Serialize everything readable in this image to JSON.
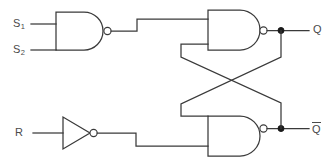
{
  "diagram": {
    "type": "logic-circuit-schematic",
    "background_color": "#ffffff",
    "line_color": "#3a3a3a",
    "label_color": "#4a4a4a",
    "width": 334,
    "height": 163,
    "inputs": [
      {
        "id": "s1",
        "label": "S",
        "subscript": "1",
        "y": 24
      },
      {
        "id": "s2",
        "label": "S",
        "subscript": "2",
        "y": 50
      },
      {
        "id": "r",
        "label": "R",
        "subscript": "",
        "y": 133
      }
    ],
    "outputs": [
      {
        "id": "q",
        "label": "Q",
        "overbar": false,
        "y": 30
      },
      {
        "id": "qbar",
        "label": "Q",
        "overbar": true,
        "y": 128
      }
    ],
    "gates": [
      {
        "id": "nand-input",
        "kind": "nand-gate",
        "inputs": [
          "S1",
          "S2"
        ],
        "output": "set-line"
      },
      {
        "id": "nand-q",
        "kind": "nand-gate",
        "inputs": [
          "set-line",
          "qbar-feedback"
        ],
        "output": "Q"
      },
      {
        "id": "nand-qbar",
        "kind": "nand-gate",
        "inputs": [
          "q-feedback",
          "reset-line"
        ],
        "output": "Qbar"
      },
      {
        "id": "inverter-r",
        "kind": "not-gate",
        "inputs": [
          "R"
        ],
        "output": "reset-line"
      }
    ],
    "junctions": [
      {
        "id": "q-node",
        "x": 281,
        "y": 31
      },
      {
        "id": "qbar-node",
        "x": 281,
        "y": 129
      }
    ],
    "feedback": {
      "description": "cross-coupled",
      "crossing_point": {
        "x": 229,
        "y": 81
      }
    }
  }
}
